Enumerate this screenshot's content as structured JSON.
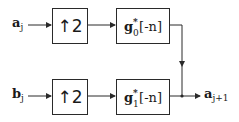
{
  "diagram": {
    "title": "",
    "inputs": [
      {
        "id": "a",
        "label": "a",
        "subscript": "j"
      },
      {
        "id": "b",
        "label": "b",
        "subscript": "j"
      }
    ],
    "blocks": {
      "top_upsample": {
        "label": "↑2"
      },
      "top_filter": {
        "base": "g",
        "superscript": "*",
        "subscript": "0",
        "arg": "[-n]"
      },
      "bottom_upsample": {
        "label": "↑2"
      },
      "bottom_filter": {
        "base": "g",
        "superscript": "*",
        "subscript": "1",
        "arg": "[-n]"
      }
    },
    "output": {
      "label": "a",
      "subscript": "j+1"
    },
    "edges": [
      {
        "from": "a_j",
        "to": "top_upsample"
      },
      {
        "from": "top_upsample",
        "to": "top_filter"
      },
      {
        "from": "top_filter",
        "to": "sum_node"
      },
      {
        "from": "b_j",
        "to": "bottom_upsample"
      },
      {
        "from": "bottom_upsample",
        "to": "bottom_filter"
      },
      {
        "from": "bottom_filter",
        "to": "sum_node"
      },
      {
        "from": "sum_node",
        "to": "a_j+1"
      }
    ],
    "colors": {
      "stroke": "#2a2a2a",
      "background": "#ffffff"
    }
  }
}
